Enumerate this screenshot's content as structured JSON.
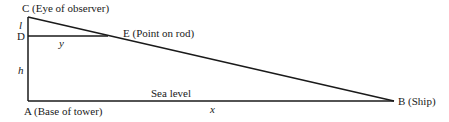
{
  "labels": {
    "C": "C (Eye of observer)",
    "D": "D",
    "E": "E (Point on rod)",
    "A": "A (Base of tower)",
    "B": "B (Ship)",
    "sea_level": "Sea level",
    "l": "l",
    "y": "y",
    "h": "h",
    "x": "x"
  },
  "points": {
    "C": [
      28,
      17
    ],
    "D": [
      28,
      36
    ],
    "E": [
      108,
      36
    ],
    "A": [
      28,
      101
    ],
    "B": [
      394,
      101
    ]
  },
  "colors": {
    "line": "#1a1a1a",
    "background": "#ffffff"
  }
}
